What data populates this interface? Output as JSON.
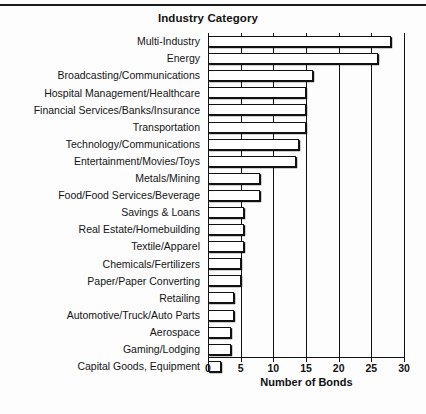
{
  "chart_data": {
    "type": "bar",
    "orientation": "horizontal",
    "title": "Industry Category",
    "xlabel": "Number of Bonds",
    "ylabel": "Industry Category",
    "xlim": [
      0,
      30
    ],
    "xticks": [
      0,
      5,
      10,
      15,
      20,
      25,
      30
    ],
    "grid": true,
    "grid_axis": "x",
    "legend": null,
    "bar_color": "#ffffff",
    "bar_edge_color": "#111111",
    "categories": [
      "Multi-Industry",
      "Energy",
      "Broadcasting/Communications",
      "Hospital Management/Healthcare",
      "Financial Services/Banks/Insurance",
      "Transportation",
      "Technology/Communications",
      "Entertainment/Movies/Toys",
      "Metals/Mining",
      "Food/Food Services/Beverage",
      "Savings & Loans",
      "Real Estate/Homebuilding",
      "Textile/Apparel",
      "Chemicals/Fertilizers",
      "Paper/Paper Converting",
      "Retailing",
      "Automotive/Truck/Auto Parts",
      "Aerospace",
      "Gaming/Lodging",
      "Capital Goods, Equipment"
    ],
    "values": [
      28,
      26,
      16,
      15,
      15,
      15,
      14,
      13.5,
      8,
      8,
      5.5,
      5.5,
      5.5,
      5,
      5,
      4,
      4,
      3.5,
      3.5,
      2
    ]
  }
}
